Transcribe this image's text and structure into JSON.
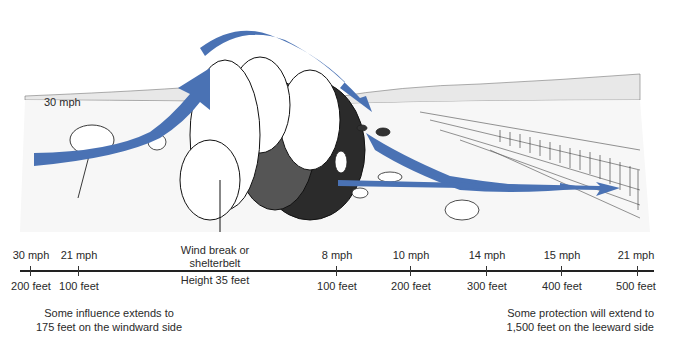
{
  "diagram": {
    "title_inline_label": "30 mph",
    "arrow_color": "#4a72b4",
    "windbreak": {
      "label_line1": "Wind break or",
      "label_line2": "shelterbelt",
      "height": "Height 35 feet"
    },
    "axis_points": [
      {
        "speed": "30 mph",
        "distance": "200 feet",
        "side": "windward"
      },
      {
        "speed": "21 mph",
        "distance": "100 feet",
        "side": "windward"
      },
      {
        "speed": "8 mph",
        "distance": "100 feet",
        "side": "leeward"
      },
      {
        "speed": "10 mph",
        "distance": "200 feet",
        "side": "leeward"
      },
      {
        "speed": "14 mph",
        "distance": "300 feet",
        "side": "leeward"
      },
      {
        "speed": "15 mph",
        "distance": "400 feet",
        "side": "leeward"
      },
      {
        "speed": "21 mph",
        "distance": "500 feet",
        "side": "leeward"
      }
    ],
    "notes": {
      "windward_line1": "Some influence extends to",
      "windward_line2": "175 feet on the windward side",
      "leeward_line1": "Some protection will extend to",
      "leeward_line2": "1,500 feet on the leeward side"
    }
  }
}
